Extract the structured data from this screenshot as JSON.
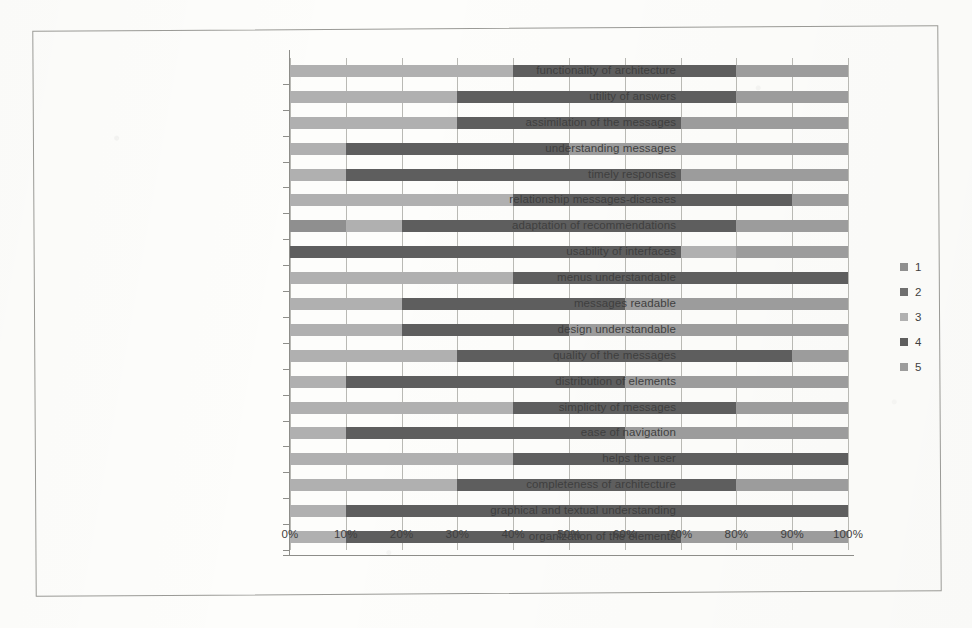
{
  "chart_data": {
    "type": "bar",
    "subtype": "100% stacked horizontal bar",
    "title": "",
    "xlabel": "",
    "ylabel": "",
    "xlim": [
      0,
      100
    ],
    "xticks": [
      "0%",
      "10%",
      "20%",
      "30%",
      "40%",
      "50%",
      "60%",
      "70%",
      "80%",
      "90%",
      "100%"
    ],
    "grid": true,
    "legend_position": "right",
    "legend": [
      "1",
      "2",
      "3",
      "4",
      "5"
    ],
    "series_colors": [
      "#8f8f8f",
      "#6f6f6f",
      "#b0b0b0",
      "#5e5e5e",
      "#9c9c9c"
    ],
    "categories": [
      "functionality of architecture",
      "utility of answers",
      "assimilation of the messages",
      "understanding messages",
      "timely responses",
      "relationship messages-diseases",
      "adaptation of recommendations",
      "usability of interfaces",
      "menus understandable",
      "messages readable",
      "design understandable",
      "quality of the messages",
      "distribution of elements",
      "simplicity of messages",
      "ease of navigation",
      "helps the user",
      "completeness of architecture",
      "graphical and textual understanding",
      "organization of the elements"
    ],
    "series": [
      {
        "name": "1",
        "values": [
          0,
          0,
          0,
          0,
          0,
          0,
          10,
          0,
          0,
          0,
          0,
          0,
          0,
          0,
          0,
          0,
          0,
          0,
          0
        ]
      },
      {
        "name": "2",
        "values": [
          0,
          0,
          0,
          0,
          0,
          0,
          0,
          0,
          0,
          0,
          0,
          0,
          0,
          0,
          0,
          0,
          0,
          0,
          0
        ]
      },
      {
        "name": "3",
        "values": [
          40,
          30,
          30,
          10,
          10,
          40,
          10,
          0,
          40,
          20,
          20,
          30,
          10,
          40,
          10,
          40,
          30,
          10,
          10
        ]
      },
      {
        "name": "4",
        "values": [
          40,
          50,
          40,
          40,
          60,
          50,
          60,
          70,
          60,
          40,
          30,
          60,
          50,
          40,
          50,
          60,
          50,
          90,
          60
        ]
      },
      {
        "name": "5",
        "values": [
          20,
          20,
          30,
          50,
          30,
          10,
          20,
          30,
          0,
          40,
          50,
          10,
          40,
          20,
          40,
          0,
          20,
          0,
          30
        ]
      }
    ],
    "rows": [
      {
        "label": "functionality of architecture",
        "segments": [
          {
            "s": "3",
            "v": 40
          },
          {
            "s": "4",
            "v": 40
          },
          {
            "s": "5",
            "v": 20
          }
        ]
      },
      {
        "label": "utility of answers",
        "segments": [
          {
            "s": "3",
            "v": 30
          },
          {
            "s": "4",
            "v": 50
          },
          {
            "s": "5",
            "v": 20
          }
        ]
      },
      {
        "label": "assimilation of the messages",
        "segments": [
          {
            "s": "3",
            "v": 30
          },
          {
            "s": "4",
            "v": 40
          },
          {
            "s": "5",
            "v": 30
          }
        ]
      },
      {
        "label": "understanding messages",
        "segments": [
          {
            "s": "3",
            "v": 10
          },
          {
            "s": "4",
            "v": 40
          },
          {
            "s": "5",
            "v": 50
          }
        ]
      },
      {
        "label": "timely responses",
        "segments": [
          {
            "s": "3",
            "v": 10
          },
          {
            "s": "4",
            "v": 60
          },
          {
            "s": "5",
            "v": 30
          }
        ]
      },
      {
        "label": "relationship messages-diseases",
        "segments": [
          {
            "s": "3",
            "v": 40
          },
          {
            "s": "4",
            "v": 50
          },
          {
            "s": "5",
            "v": 10
          }
        ]
      },
      {
        "label": "adaptation of recommendations",
        "segments": [
          {
            "s": "1",
            "v": 10
          },
          {
            "s": "3",
            "v": 10
          },
          {
            "s": "4",
            "v": 60
          },
          {
            "s": "5",
            "v": 20
          }
        ]
      },
      {
        "label": "usability of interfaces",
        "segments": [
          {
            "s": "4",
            "v": 70
          },
          {
            "s": "3",
            "v": 10
          },
          {
            "s": "5",
            "v": 20
          }
        ]
      },
      {
        "label": "menus understandable",
        "segments": [
          {
            "s": "3",
            "v": 40
          },
          {
            "s": "4",
            "v": 60
          }
        ]
      },
      {
        "label": "messages readable",
        "segments": [
          {
            "s": "3",
            "v": 20
          },
          {
            "s": "4",
            "v": 40
          },
          {
            "s": "5",
            "v": 40
          }
        ]
      },
      {
        "label": "design understandable",
        "segments": [
          {
            "s": "3",
            "v": 20
          },
          {
            "s": "4",
            "v": 30
          },
          {
            "s": "5",
            "v": 50
          }
        ]
      },
      {
        "label": "quality of the messages",
        "segments": [
          {
            "s": "3",
            "v": 30
          },
          {
            "s": "4",
            "v": 60
          },
          {
            "s": "5",
            "v": 10
          }
        ]
      },
      {
        "label": "distribution of elements",
        "segments": [
          {
            "s": "3",
            "v": 10
          },
          {
            "s": "4",
            "v": 50
          },
          {
            "s": "5",
            "v": 40
          }
        ]
      },
      {
        "label": "simplicity of messages",
        "segments": [
          {
            "s": "3",
            "v": 40
          },
          {
            "s": "4",
            "v": 40
          },
          {
            "s": "5",
            "v": 20
          }
        ]
      },
      {
        "label": "ease of navigation",
        "segments": [
          {
            "s": "3",
            "v": 10
          },
          {
            "s": "4",
            "v": 50
          },
          {
            "s": "5",
            "v": 40
          }
        ]
      },
      {
        "label": "helps the user",
        "segments": [
          {
            "s": "3",
            "v": 40
          },
          {
            "s": "4",
            "v": 60
          }
        ]
      },
      {
        "label": "completeness of architecture",
        "segments": [
          {
            "s": "3",
            "v": 30
          },
          {
            "s": "4",
            "v": 50
          },
          {
            "s": "5",
            "v": 20
          }
        ]
      },
      {
        "label": "graphical and textual understanding",
        "segments": [
          {
            "s": "3",
            "v": 10
          },
          {
            "s": "4",
            "v": 90
          }
        ]
      },
      {
        "label": "organization of the elements",
        "segments": [
          {
            "s": "3",
            "v": 10
          },
          {
            "s": "4",
            "v": 60
          },
          {
            "s": "5",
            "v": 30
          }
        ]
      }
    ]
  }
}
